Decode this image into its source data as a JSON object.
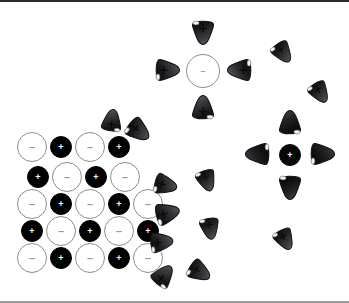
{
  "figure": {
    "width": 349,
    "height": 303,
    "background_color": "#ffffff",
    "border_color": "#2b2b2f"
  },
  "legend_signs": {
    "positive": "+",
    "negative": "–"
  },
  "colors": {
    "cation_fill": "#000000",
    "anion_fill": "#ffffff",
    "anion_stroke": "#8d8d92",
    "water_fill": "#3a3a3c",
    "water_stroke": "#141416",
    "water_tip": "#f2f2f0"
  },
  "lattice": {
    "label": "ionic crystal lattice",
    "rows": [
      {
        "row_index": 1,
        "ions": [
          {
            "sign": "–",
            "charge": "negative",
            "cx": 32,
            "cy": 147,
            "r": 15
          },
          {
            "sign": "+",
            "charge": "positive",
            "cx": 61,
            "cy": 147,
            "r": 11
          },
          {
            "sign": "–",
            "charge": "negative",
            "cx": 90,
            "cy": 147,
            "r": 15
          },
          {
            "sign": "+",
            "charge": "positive",
            "cx": 119,
            "cy": 147,
            "r": 11
          }
        ]
      },
      {
        "row_index": 2,
        "ions": [
          {
            "sign": "+",
            "charge": "positive",
            "cx": 38,
            "cy": 177,
            "r": 11
          },
          {
            "sign": "–",
            "charge": "negative",
            "cx": 67,
            "cy": 177,
            "r": 15
          },
          {
            "sign": "+",
            "charge": "positive",
            "cx": 96,
            "cy": 177,
            "r": 11
          },
          {
            "sign": "–",
            "charge": "negative",
            "cx": 125,
            "cy": 177,
            "r": 15
          }
        ]
      },
      {
        "row_index": 3,
        "ions": [
          {
            "sign": "–",
            "charge": "negative",
            "cx": 32,
            "cy": 204,
            "r": 15
          },
          {
            "sign": "+",
            "charge": "positive",
            "cx": 61,
            "cy": 204,
            "r": 11
          },
          {
            "sign": "–",
            "charge": "negative",
            "cx": 90,
            "cy": 204,
            "r": 15
          },
          {
            "sign": "+",
            "charge": "positive",
            "cx": 119,
            "cy": 204,
            "r": 11
          },
          {
            "sign": "–",
            "charge": "negative",
            "cx": 148,
            "cy": 204,
            "r": 15
          }
        ]
      },
      {
        "row_index": 4,
        "ions": [
          {
            "sign": "+",
            "charge": "positive",
            "cx": 32,
            "cy": 231,
            "r": 11
          },
          {
            "sign": "–",
            "charge": "negative",
            "cx": 61,
            "cy": 231,
            "r": 15
          },
          {
            "sign": "+",
            "charge": "positive",
            "cx": 90,
            "cy": 231,
            "r": 11
          },
          {
            "sign": "–",
            "charge": "negative",
            "cx": 119,
            "cy": 231,
            "r": 15
          },
          {
            "sign": "+",
            "charge": "positive",
            "cx": 148,
            "cy": 231,
            "r": 11
          }
        ]
      },
      {
        "row_index": 5,
        "ions": [
          {
            "sign": "–",
            "charge": "negative",
            "cx": 32,
            "cy": 258,
            "r": 15
          },
          {
            "sign": "+",
            "charge": "positive",
            "cx": 61,
            "cy": 258,
            "r": 11
          },
          {
            "sign": "–",
            "charge": "negative",
            "cx": 90,
            "cy": 258,
            "r": 15
          },
          {
            "sign": "+",
            "charge": "positive",
            "cx": 119,
            "cy": 258,
            "r": 11
          },
          {
            "sign": "–",
            "charge": "negative",
            "cx": 148,
            "cy": 258,
            "r": 15
          }
        ]
      }
    ]
  },
  "solvated_ions": [
    {
      "name": "solvated-anion",
      "sign": "–",
      "charge": "negative",
      "cx": 203,
      "cy": 71,
      "r": 17,
      "shell": [
        {
          "sign": "+",
          "cx": 203,
          "cy": 33,
          "rot": 180,
          "scale": 1.0
        },
        {
          "sign": "+",
          "cx": 203,
          "cy": 107,
          "rot": 0,
          "scale": 1.0
        },
        {
          "sign": "+",
          "cx": 168,
          "cy": 70,
          "rot": 90,
          "scale": 1.0
        },
        {
          "sign": "+",
          "cx": 239,
          "cy": 70,
          "rot": -90,
          "scale": 1.0
        }
      ]
    },
    {
      "name": "solvated-cation",
      "sign": "+",
      "charge": "positive",
      "cx": 290,
      "cy": 155,
      "r": 11,
      "shell": [
        {
          "sign": "",
          "cx": 290,
          "cy": 122,
          "rot": 0,
          "scale": 1.0
        },
        {
          "sign": "",
          "cx": 290,
          "cy": 188,
          "rot": 180,
          "scale": 1.0
        },
        {
          "sign": "",
          "cx": 257,
          "cy": 154,
          "rot": -90,
          "scale": 1.0
        },
        {
          "sign": "",
          "cx": 323,
          "cy": 154,
          "rot": 90,
          "scale": 1.0
        }
      ]
    }
  ],
  "free_water_molecules": [
    {
      "id": "w01",
      "sign": "+",
      "cx": 112,
      "cy": 120,
      "rot": 8,
      "scale": 0.92
    },
    {
      "id": "w02",
      "sign": "+",
      "cx": 139,
      "cy": 131,
      "rot": 128,
      "scale": 1.0
    },
    {
      "id": "w03",
      "sign": "+",
      "cx": 166,
      "cy": 185,
      "rot": 104,
      "scale": 0.95
    },
    {
      "id": "w04",
      "sign": "+",
      "cx": 168,
      "cy": 213,
      "rot": 76,
      "scale": 1.0
    },
    {
      "id": "w05",
      "sign": "+",
      "cx": 162,
      "cy": 242,
      "rot": 84,
      "scale": 0.95
    },
    {
      "id": "w06",
      "sign": "+",
      "cx": 164,
      "cy": 275,
      "rot": 38,
      "scale": 0.95
    },
    {
      "id": "w07",
      "sign": "+",
      "cx": 200,
      "cy": 272,
      "rot": 122,
      "scale": 0.95
    },
    {
      "id": "w08",
      "sign": "+",
      "cx": 207,
      "cy": 181,
      "rot": 160,
      "scale": 0.9
    },
    {
      "id": "w09",
      "sign": "+",
      "cx": 210,
      "cy": 229,
      "rot": 170,
      "scale": 0.9
    },
    {
      "id": "w10",
      "sign": "+",
      "cx": 283,
      "cy": 53,
      "rot": 145,
      "scale": 0.9
    },
    {
      "id": "w11",
      "sign": "+",
      "cx": 320,
      "cy": 93,
      "rot": 148,
      "scale": 0.9
    },
    {
      "id": "w12",
      "sign": "+",
      "cx": 285,
      "cy": 240,
      "rot": 152,
      "scale": 0.9
    }
  ]
}
